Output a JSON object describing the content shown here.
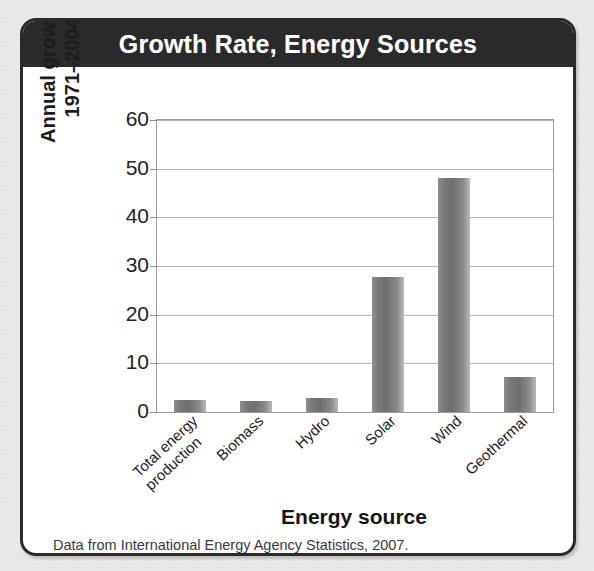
{
  "figure": {
    "title": "Growth Rate, Energy Sources",
    "caption": "Data from International Energy Agency Statistics, 2007.",
    "header_bg": "#2a2a2a",
    "title_color": "#ffffff",
    "border_color": "#2a2a2a",
    "page_bg": "#eceae7",
    "bar_color": "#7a7a7a"
  },
  "chart_data": {
    "type": "bar",
    "title": "Growth Rate, Energy Sources",
    "xlabel": "Energy source",
    "ylabel": "Annual growth rate,\n1971–2004 (%)",
    "categories": [
      "Total energy\nproduction",
      "Biomass",
      "Hydro",
      "Solar",
      "Wind",
      "Geothermal"
    ],
    "values": [
      2.4,
      2.3,
      2.9,
      27.8,
      48.0,
      7.2
    ],
    "ylim": [
      0,
      60
    ],
    "yticks": [
      0,
      10,
      20,
      30,
      40,
      50,
      60
    ],
    "ytick_labels": [
      "0",
      "10",
      "20",
      "30",
      "40",
      "50",
      "60"
    ],
    "grid": true,
    "legend": null,
    "source_note": "Data from International Energy Agency Statistics, 2007."
  }
}
